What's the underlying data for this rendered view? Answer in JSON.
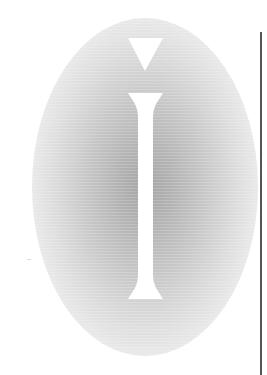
{
  "graphic": {
    "subject": "text-cursor-ibeam-with-caret",
    "colors": {
      "background": "#ffffff",
      "glow_center": "#a4a4a4",
      "cursor_fill": "#ffffff",
      "divider_line": "#555555"
    },
    "icons": [
      "caret-down-icon",
      "ibeam-cursor-icon"
    ]
  }
}
